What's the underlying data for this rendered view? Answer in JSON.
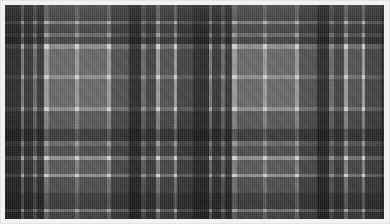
{
  "image": {
    "kind": "tartan-fabric-swatch",
    "description": "Grayscale tartan / plaid woven fabric swatch photographed flat, framed by a thin white mount",
    "width_px": 390,
    "height_px": 224,
    "border": {
      "name": "white-mount-border",
      "color": "#f2f2f0",
      "inner_edge_color": "#c9c9c7",
      "thickness_px": 5
    }
  },
  "palette": {
    "charcoal": "#3a3a3a",
    "dark_gray": "#4c4c4c",
    "mid_dark": "#5e5e5e",
    "mid_gray": "#767676",
    "ground_gray": "#9a9a9a",
    "pale_gray": "#b4b4b4",
    "guard_white": "#e8e8e8"
  },
  "weave": {
    "type": "2/2 twill",
    "thread_direction": "diagonal 45 degrees",
    "symmetric_sett": true,
    "sett_period_px": 188,
    "note": "Warp and weft use the same stripe sequence, producing square blocks; crossings of two dark stripes read as solid charcoal while dark-over-light crossings read as a fine checkered half-tone."
  },
  "chart_data": {
    "type": "heatmap",
    "xlabel": "Warp position (px)",
    "ylabel": "Weft position (px)",
    "grid": false,
    "legend_position": "none",
    "sett_period_px": 188,
    "stripes": [
      {
        "offset": 0,
        "width": 16,
        "color": "#3a3a3a",
        "name": "charcoal-block"
      },
      {
        "offset": 16,
        "width": 3,
        "color": "#b4b4b4",
        "name": "pale-pinstripe"
      },
      {
        "offset": 19,
        "width": 9,
        "color": "#4c4c4c",
        "name": "dark-bar"
      },
      {
        "offset": 28,
        "width": 4,
        "color": "#9a9a9a",
        "name": "ground-gap"
      },
      {
        "offset": 32,
        "width": 7,
        "color": "#4c4c4c",
        "name": "dark-bar"
      },
      {
        "offset": 39,
        "width": 5,
        "color": "#e8e8e8",
        "name": "guard-white"
      },
      {
        "offset": 44,
        "width": 26,
        "color": "#9a9a9a",
        "name": "ground-field"
      },
      {
        "offset": 70,
        "width": 4,
        "color": "#e8e8e8",
        "name": "guard-white"
      },
      {
        "offset": 74,
        "width": 28,
        "color": "#9a9a9a",
        "name": "ground-field"
      },
      {
        "offset": 102,
        "width": 4,
        "color": "#e8e8e8",
        "name": "guard-white"
      },
      {
        "offset": 106,
        "width": 18,
        "color": "#767676",
        "name": "mid-field"
      },
      {
        "offset": 124,
        "width": 12,
        "color": "#3a3a3a",
        "name": "charcoal-block"
      },
      {
        "offset": 136,
        "width": 5,
        "color": "#9a9a9a",
        "name": "ground-gap"
      },
      {
        "offset": 141,
        "width": 10,
        "color": "#5e5e5e",
        "name": "mid-dark-bar"
      },
      {
        "offset": 151,
        "width": 4,
        "color": "#e8e8e8",
        "name": "guard-white"
      },
      {
        "offset": 155,
        "width": 14,
        "color": "#767676",
        "name": "mid-field"
      },
      {
        "offset": 169,
        "width": 3,
        "color": "#e8e8e8",
        "name": "guard-white"
      },
      {
        "offset": 172,
        "width": 16,
        "color": "#5e5e5e",
        "name": "mid-dark-field"
      }
    ],
    "tone_levels": {
      "labels": [
        "charcoal",
        "dark gray",
        "mid dark",
        "mid gray",
        "ground gray",
        "pale gray",
        "guard white"
      ],
      "values": [
        58,
        76,
        94,
        118,
        154,
        180,
        232
      ]
    }
  }
}
